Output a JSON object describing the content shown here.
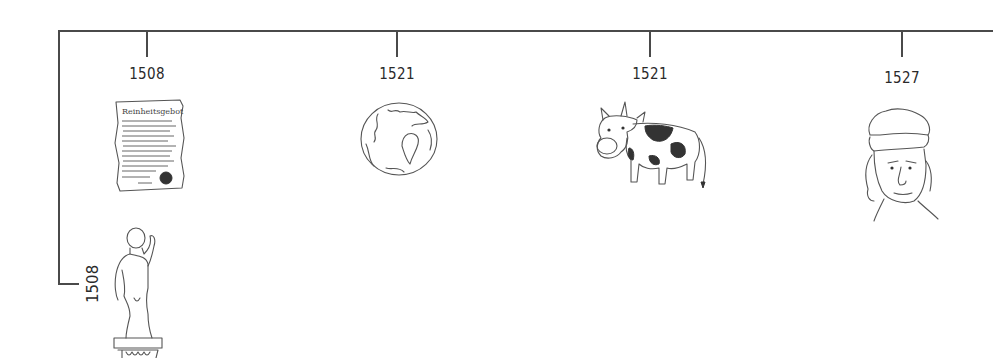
{
  "timeline": {
    "events": [
      {
        "year": "1508",
        "illustration": "document-icon",
        "caption": "Reinheitsgebot"
      },
      {
        "year": "1521",
        "illustration": "globe-icon"
      },
      {
        "year": "1521",
        "illustration": "cow-icon"
      },
      {
        "year": "1527",
        "illustration": "portrait-icon"
      }
    ],
    "branch_event": {
      "year": "1508",
      "illustration": "statue-icon"
    }
  }
}
